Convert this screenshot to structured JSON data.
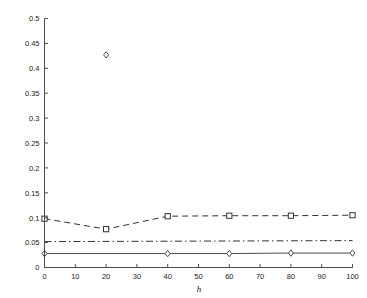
{
  "chart_data": {
    "type": "line",
    "title": "",
    "subtitle": "",
    "xlabel": "h",
    "ylabel": "",
    "xlim": [
      0,
      100
    ],
    "ylim": [
      0,
      0.5
    ],
    "grid": false,
    "legend": "none",
    "x_ticks": [
      0,
      10,
      20,
      30,
      40,
      50,
      60,
      70,
      80,
      90,
      100
    ],
    "x_tick_labels": [
      "0",
      "10",
      "20",
      "30",
      "40",
      "50",
      "60",
      "70",
      "80",
      "90",
      "100"
    ],
    "y_ticks": [
      0,
      0.05,
      0.1,
      0.15,
      0.2,
      0.25,
      0.3,
      0.35,
      0.4,
      0.45,
      0.5
    ],
    "y_tick_labels": [
      "0",
      "0.05",
      "0.1",
      "0.15",
      "0.2",
      "0.25",
      "0.3",
      "0.35",
      "0.4",
      "0.45",
      "0.5"
    ],
    "series": [
      {
        "name": "dashed-square-series",
        "linestyle": "dashed",
        "marker": "square",
        "color": "#333333",
        "x": [
          0,
          20,
          40,
          60,
          80,
          100
        ],
        "values": [
          0.098,
          0.077,
          0.103,
          0.104,
          0.104,
          0.105
        ]
      },
      {
        "name": "dash-dot-series",
        "linestyle": "dashdot",
        "marker": "none",
        "color": "#333333",
        "x": [
          0,
          100
        ],
        "values": [
          0.052,
          0.054
        ]
      },
      {
        "name": "solid-diamond-series",
        "linestyle": "solid",
        "marker": "diamond",
        "color": "#4d4d4d",
        "x": [
          0,
          20,
          40,
          60,
          80,
          100
        ],
        "values": [
          0.028,
          0.427,
          0.028,
          0.028,
          0.029,
          0.029
        ]
      }
    ],
    "annotations": [
      {
        "label": "outlier-diamond",
        "x": 20,
        "y": 0.427
      },
      {
        "label": "outlier-square",
        "x": 20,
        "y": 0.077
      }
    ]
  },
  "axis_title": {
    "x": "h"
  }
}
